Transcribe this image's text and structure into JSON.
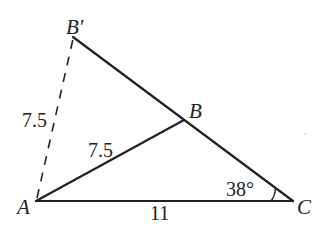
{
  "diagram": {
    "type": "geometry-triangle",
    "stroke_color": "#222222",
    "background": "#ffffff",
    "vertices": {
      "A": {
        "label": "A",
        "x": 36,
        "y": 201
      },
      "B": {
        "label": "B",
        "x": 184,
        "y": 120
      },
      "B_prime": {
        "label": "B′",
        "x": 73,
        "y": 37
      },
      "C": {
        "label": "C",
        "x": 293,
        "y": 201
      }
    },
    "segments": [
      {
        "from": "A",
        "to": "C",
        "style": "solid",
        "length_label": "11"
      },
      {
        "from": "A",
        "to": "B",
        "style": "solid",
        "length_label": "7.5"
      },
      {
        "from": "B_prime",
        "to": "C",
        "style": "solid",
        "length_label": ""
      },
      {
        "from": "A",
        "to": "B_prime",
        "style": "dashed",
        "length_label": "7.5"
      }
    ],
    "angles": [
      {
        "vertex": "C",
        "label": "38°"
      }
    ],
    "labels": {
      "A": "A",
      "B": "B",
      "B_prime": "B′",
      "C": "C",
      "AB": "7.5",
      "AB_prime": "7.5",
      "AC": "11",
      "angle_C": "38°"
    }
  }
}
